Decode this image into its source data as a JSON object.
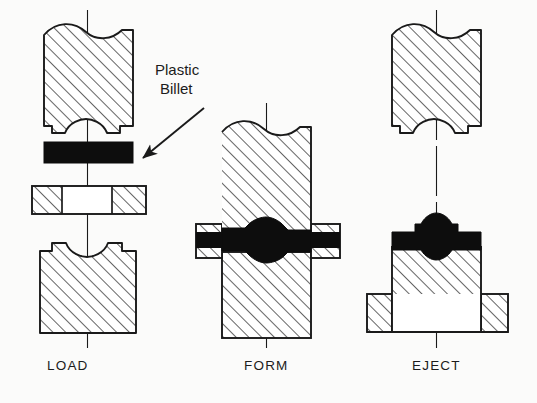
{
  "figure": {
    "background_color": "#fbfbfa",
    "line_color": "#1a1a1a",
    "hatch_color": "#1a1a1a",
    "billet_fill": "#0d0d0d",
    "tool_fill": "#ffffff"
  },
  "callout": {
    "line1": "Plastic",
    "line2": "Billet",
    "arrow": "arrow pointing down-left to black billet"
  },
  "stages": [
    {
      "id": "load",
      "label": "LOAD",
      "description": "Upper punch raised, flat black plastic billet resting above open die ring and lower die",
      "parts": [
        "upper-punch",
        "plastic-billet",
        "die-ring",
        "lower-die"
      ]
    },
    {
      "id": "form",
      "label": "FORM",
      "description": "Punch closed into die, billet compressed and flowed into the cavity between the dies",
      "parts": [
        "upper-punch",
        "formed-part",
        "side-die-left",
        "side-die-right",
        "lower-die"
      ]
    },
    {
      "id": "eject",
      "label": "EJECT",
      "description": "Punch withdrawn upward, formed part released on the lower die with ejector base",
      "parts": [
        "upper-punch",
        "formed-part",
        "lower-die",
        "ejector-base"
      ]
    }
  ]
}
